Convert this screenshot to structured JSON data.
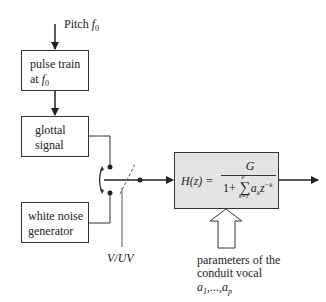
{
  "pitch": {
    "label": "Pitch",
    "var": "f",
    "sub": "0"
  },
  "pulse_box": {
    "line1": "pulse train",
    "line2": "at",
    "var": "f",
    "sub": "0"
  },
  "glottal_box": {
    "line1": "glottal",
    "line2": "signal"
  },
  "noise_box": {
    "line1": "white noise",
    "line2": "generator"
  },
  "switch": {
    "label": "V/UV"
  },
  "filter": {
    "lhs": "H(z) =",
    "numerator": "G",
    "denom_prefix": "1+",
    "sum": "∑",
    "sum_upper": "p",
    "sum_lower": "k=1",
    "term": "a",
    "term_sub": "k",
    "z": "z",
    "z_exp": "−k"
  },
  "params": {
    "line1": "parameters of the",
    "line2": "conduit vocal",
    "coeffs_a": "a",
    "coeffs_sub1": "1",
    "coeffs_mid": ",...,",
    "coeffs_sub2": "p"
  },
  "colors": {
    "filter_fill": "#e4e4e4",
    "stroke": "#333333"
  }
}
